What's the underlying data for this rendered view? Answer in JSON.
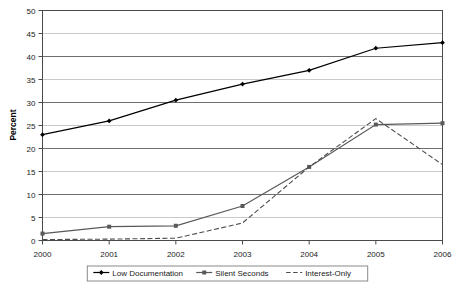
{
  "chart_data": {
    "type": "line",
    "title": "",
    "xlabel": "",
    "ylabel": "Percent",
    "categories": [
      "2000",
      "2001",
      "2002",
      "2003",
      "2004",
      "2005",
      "2006"
    ],
    "x": [
      2000,
      2001,
      2002,
      2003,
      2004,
      2005,
      2006
    ],
    "ylim": [
      0,
      50
    ],
    "y_ticks": [
      0,
      5,
      10,
      15,
      20,
      25,
      30,
      35,
      40,
      45,
      50
    ],
    "grid": true,
    "legend_position": "bottom",
    "series": [
      {
        "name": "Low Documentation",
        "marker": "diamond",
        "line_style": "solid",
        "color": "#000000",
        "values": [
          23,
          26,
          30.5,
          34,
          37,
          41.8,
          43
        ]
      },
      {
        "name": "Silent Seconds",
        "marker": "square",
        "line_style": "solid",
        "color": "#595959",
        "values": [
          1.5,
          3,
          3.2,
          7.5,
          16,
          25.2,
          25.5
        ]
      },
      {
        "name": "Interest-Only",
        "marker": "none",
        "line_style": "dashed",
        "color": "#4d4d4d",
        "values": [
          0.2,
          0.3,
          0.5,
          3.8,
          16,
          26.5,
          16.5
        ]
      }
    ]
  },
  "axes": {
    "y_tick_labels": [
      "0",
      "5",
      "10",
      "15",
      "20",
      "25",
      "30",
      "35",
      "40",
      "45",
      "50"
    ],
    "x_tick_labels": [
      "2000",
      "2001",
      "2002",
      "2003",
      "2004",
      "2005",
      "2006"
    ],
    "y_title": "Percent"
  },
  "legend": {
    "items": [
      {
        "label": "Low Documentation"
      },
      {
        "label": "Silent Seconds"
      },
      {
        "label": "Interest-Only"
      }
    ]
  }
}
